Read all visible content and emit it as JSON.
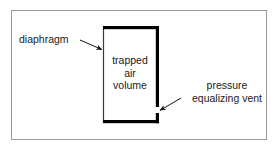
{
  "figure": {
    "type": "labeled-schematic-diagram",
    "frame": {
      "border_color": "#9a9a9a",
      "background_color": "#ffffff",
      "x": 11,
      "y": 10,
      "width": 256,
      "height": 130
    },
    "chamber": {
      "name": "trapped-air-chamber",
      "fill_color": "#ffffff",
      "thick_wall_color": "#000000",
      "thin_wall_color": "#333333",
      "x": 103,
      "y": 26,
      "width": 56,
      "height": 97,
      "vent_gap": {
        "side": "right",
        "y": 107,
        "height": 6
      }
    },
    "labels": {
      "diaphragm": "diaphragm",
      "trapped_air_volume": "trapped\nair\nvolume",
      "trapped_air_volume_lines": [
        "trapped",
        "air",
        "volume"
      ],
      "pressure_equalizing_vent": "pressure\nequalizing vent",
      "pressure_equalizing_vent_lines": [
        "pressure",
        "equalizing vent"
      ]
    },
    "leaders": [
      {
        "name": "diaphragm-leader",
        "from_label": "diaphragm",
        "points_to": "left wall of chamber",
        "x1": 80,
        "y1": 40,
        "x2": 103,
        "y2": 50
      },
      {
        "name": "vent-leader",
        "from_label": "pressure equalizing vent",
        "points_to": "gap in right wall of chamber",
        "x1": 181,
        "y1": 98,
        "x2": 159,
        "y2": 111
      }
    ],
    "text_color": "#1a1a1a"
  }
}
